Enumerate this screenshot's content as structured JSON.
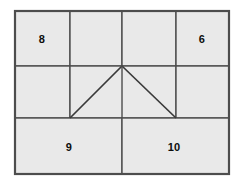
{
  "figure": {
    "colors": {
      "cell_fill": "#e9e9e9",
      "grid_line": "#4d4d4d",
      "border_line": "#4d4d4d",
      "triangle_line": "#3a3a3a",
      "label_text": "#0d0d0d",
      "background": "#ffffff"
    },
    "border": {
      "x": 15,
      "y": 11,
      "width": 214,
      "height": 163,
      "stroke_width": 2
    },
    "rows": [
      {
        "name": "top-row",
        "y_top": 11,
        "y_bottom": 66,
        "cells": 4
      },
      {
        "name": "middle-row",
        "y_top": 66,
        "y_bottom": 118,
        "cells": 3
      },
      {
        "name": "bottom-row",
        "y_top": 118,
        "y_bottom": 174,
        "cells": 2
      }
    ],
    "horizontal_lines": [
      66,
      118
    ],
    "vertical_lines": {
      "top_row": [
        70,
        122,
        176
      ],
      "middle_row": [
        70,
        176
      ],
      "bottom_row": [
        122
      ]
    },
    "triangle": {
      "apex": {
        "x": 122,
        "y": 66
      },
      "left_vertex": {
        "x": 70,
        "y": 118
      },
      "right_vertex": {
        "x": 176,
        "y": 118
      },
      "stroke_width": 1.6
    },
    "labels": [
      {
        "name": "cell-label-8",
        "text": "8",
        "x": 42,
        "y": 39
      },
      {
        "name": "cell-label-6",
        "text": "6",
        "x": 202,
        "y": 39
      },
      {
        "name": "cell-label-9",
        "text": "9",
        "x": 69,
        "y": 147
      },
      {
        "name": "cell-label-10",
        "text": "10",
        "x": 174,
        "y": 147
      }
    ]
  }
}
